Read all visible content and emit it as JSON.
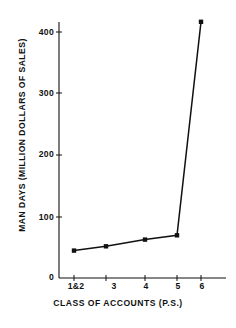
{
  "chart_data": {
    "type": "line",
    "title": "",
    "xlabel": "CLASS OF ACCOUNTS (P.S.)",
    "ylabel": "MAN DAYS (MILLION DOLLARS OF SALES)",
    "categories": [
      "1&2",
      "3",
      "4",
      "5",
      "6"
    ],
    "x": [
      1,
      2,
      3,
      4,
      5
    ],
    "values": [
      45,
      52,
      63,
      70,
      420
    ],
    "xtick_labels": [
      "1&2",
      "3",
      "4",
      "5",
      "6"
    ],
    "ytick_labels": [
      "0",
      "100",
      "200",
      "300",
      "400"
    ],
    "ytick_values": [
      0,
      100,
      200,
      300,
      400
    ],
    "ylim": [
      0,
      440
    ],
    "xlim": [
      0.45,
      5.6
    ],
    "grid": false,
    "legend": null,
    "marker": "square",
    "line_color": "#111111",
    "marker_color": "#111111",
    "axis_color": "#111111",
    "background": "#ffffff"
  },
  "axes": {
    "y_title": "MAN DAYS (MILLION DOLLARS OF SALES)",
    "x_title": "CLASS OF ACCOUNTS (P.S.)"
  }
}
